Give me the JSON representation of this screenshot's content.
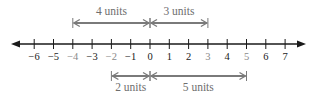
{
  "diagram": {
    "type": "number-line",
    "min": -6,
    "max": 7,
    "ticks": [
      {
        "value": -6,
        "label": "−6",
        "highlight": false
      },
      {
        "value": -5,
        "label": "−5",
        "highlight": false
      },
      {
        "value": -4,
        "label": "−4",
        "highlight": true
      },
      {
        "value": -3,
        "label": "−3",
        "highlight": false
      },
      {
        "value": -2,
        "label": "−2",
        "highlight": true
      },
      {
        "value": -1,
        "label": "−1",
        "highlight": false
      },
      {
        "value": 0,
        "label": "0",
        "highlight": false
      },
      {
        "value": 1,
        "label": "1",
        "highlight": false
      },
      {
        "value": 2,
        "label": "2",
        "highlight": false
      },
      {
        "value": 3,
        "label": "3",
        "highlight": true
      },
      {
        "value": 4,
        "label": "4",
        "highlight": false
      },
      {
        "value": 5,
        "label": "5",
        "highlight": true
      },
      {
        "value": 6,
        "label": "6",
        "highlight": false
      },
      {
        "value": 7,
        "label": "7",
        "highlight": false
      }
    ],
    "distances": [
      {
        "from": -4,
        "to": 0,
        "label": "4 units",
        "position": "above"
      },
      {
        "from": 0,
        "to": 3,
        "label": "3 units",
        "position": "above"
      },
      {
        "from": -2,
        "to": 0,
        "label": "2 units",
        "position": "below"
      },
      {
        "from": 0,
        "to": 5,
        "label": "5 units",
        "position": "below"
      }
    ],
    "colors": {
      "axis": "#1a1a1a",
      "label": "#1a1a1a",
      "highlight_label": "#8a8a8a",
      "distance_arrow": "#7a7a7a",
      "distance_label": "#6e6e6e"
    }
  }
}
